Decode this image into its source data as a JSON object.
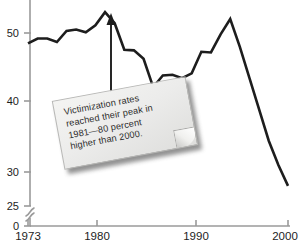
{
  "chart_data": {
    "type": "line",
    "title": "",
    "subtitle": "",
    "xlabel": "",
    "ylabel": "",
    "xlim": [
      1973,
      2000
    ],
    "ylim": [
      25,
      55
    ],
    "y_axis_break": true,
    "grid": false,
    "legend": null,
    "x": [
      1973,
      1974,
      1975,
      1976,
      1977,
      1978,
      1979,
      1980,
      1981,
      1982,
      1983,
      1984,
      1985,
      1986,
      1987,
      1988,
      1989,
      1990,
      1991,
      1992,
      1993,
      1994,
      1995,
      1996,
      1997,
      1998,
      1999,
      2000
    ],
    "values": [
      48.5,
      49.2,
      49.2,
      48.7,
      50.3,
      50.5,
      50.1,
      51.1,
      53.0,
      51.4,
      47.6,
      47.5,
      46.3,
      42.2,
      43.9,
      44.0,
      43.5,
      44.2,
      47.3,
      47.2,
      49.8,
      52.0,
      48.0,
      43.5,
      39.0,
      34.5,
      31.0,
      28.0
    ],
    "yticks": [
      25,
      30,
      40,
      50
    ],
    "ytick_labels": [
      "25",
      "30",
      "40",
      "50"
    ],
    "y_zero_label": "0",
    "xticks": [
      1973,
      1980,
      1990,
      2000
    ],
    "xtick_labels": [
      "1973",
      "1980",
      "1990",
      "2000"
    ],
    "line_color": "#1d1d1d",
    "axis_color": "#9a9a9a",
    "annotation": {
      "type": "callout-note",
      "points_to_year": 1981,
      "points_to_value": 53.0,
      "lines": [
        "Victimization rates",
        "reached their peak in",
        "1981—80 percent",
        "higher than 2000."
      ],
      "text": "Victimization rates reached their peak in 1981—80 percent higher than 2000."
    }
  },
  "axes": {
    "ytick_labels": [
      "50",
      "40",
      "30",
      "25"
    ],
    "y_zero_label": "0",
    "xtick_labels": [
      "1973",
      "1980",
      "1990",
      "2000"
    ]
  },
  "note": {
    "line1": "Victimization rates",
    "line2": "reached their peak in",
    "line3": "1981—80 percent",
    "line4": "higher than 2000."
  },
  "source": {
    "text": ""
  }
}
